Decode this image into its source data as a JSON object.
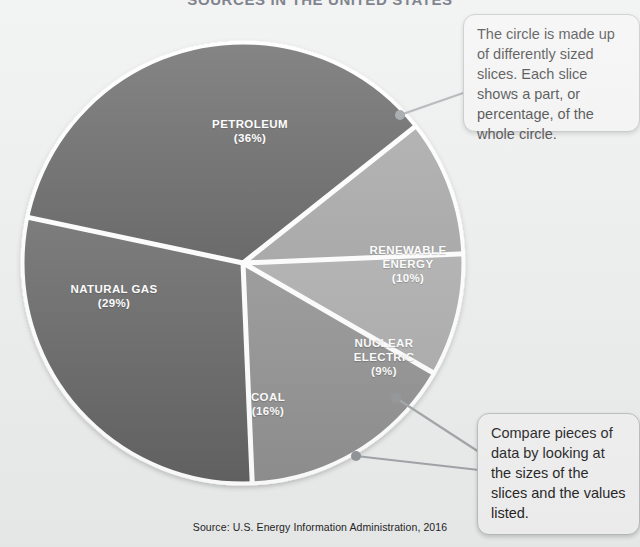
{
  "title": "SOURCES IN THE UNITED STATES",
  "source_note": "Source: U.S. Energy Information Administration, 2016",
  "callouts": {
    "top": "The circle is made up of differently sized slices. Each slice shows a part, or percentage, of the whole circle.",
    "bottom": "Compare pieces of data by looking at the sizes of the slices and the values listed."
  },
  "chart_data": {
    "type": "pie",
    "title": "SOURCES IN THE UNITED STATES",
    "source": "Source: U.S. Energy Information Administration, 2016",
    "unit": "percent",
    "categories": [
      "PETROLEUM",
      "NATURAL GAS",
      "COAL",
      "RENEWABLE ENERGY",
      "NUCLEAR ELECTRIC"
    ],
    "values": [
      36,
      29,
      16,
      10,
      9
    ],
    "labels": [
      "(36%)",
      "(29%)",
      "(16%)",
      "(10%)",
      "(9%)"
    ],
    "colors": [
      "#4b4b4b",
      "#5b5b5b",
      "#8b8b8b",
      "#9a9a9a",
      "#a6a6a6"
    ],
    "slice_separator_color": "#ffffff",
    "legend": "none",
    "grid": false,
    "slices": [
      {
        "name": "PETROLEUM",
        "value": 36,
        "label": "(36%)",
        "color": "#4b4b4b"
      },
      {
        "name": "NATURAL GAS",
        "value": 29,
        "label": "(29%)",
        "color": "#5b5b5b"
      },
      {
        "name": "COAL",
        "value": 16,
        "label": "(16%)",
        "color": "#8b8b8b"
      },
      {
        "name": "RENEWABLE ENERGY",
        "value": 10,
        "label": "(10%)",
        "color": "#9a9a9a"
      },
      {
        "name": "NUCLEAR ELECTRIC",
        "value": 9,
        "label": "(9%)",
        "color": "#a6a6a6"
      }
    ]
  }
}
